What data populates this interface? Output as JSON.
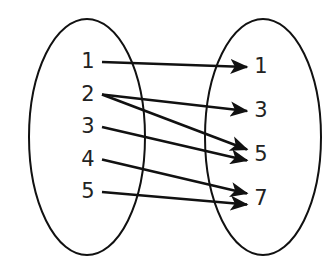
{
  "diagram": {
    "domain_set": {
      "name": "domain",
      "elements": [
        "1",
        "2",
        "3",
        "4",
        "5"
      ]
    },
    "range_set": {
      "name": "range",
      "elements": [
        "1",
        "3",
        "5",
        "7"
      ]
    },
    "mappings": [
      {
        "from": "1",
        "to": "1"
      },
      {
        "from": "2",
        "to": "3"
      },
      {
        "from": "2",
        "to": "5"
      },
      {
        "from": "3",
        "to": "5"
      },
      {
        "from": "4",
        "to": "7"
      },
      {
        "from": "5",
        "to": "7"
      }
    ],
    "colors": {
      "stroke": "#111111",
      "text": "#222222",
      "background": "#ffffff"
    }
  }
}
